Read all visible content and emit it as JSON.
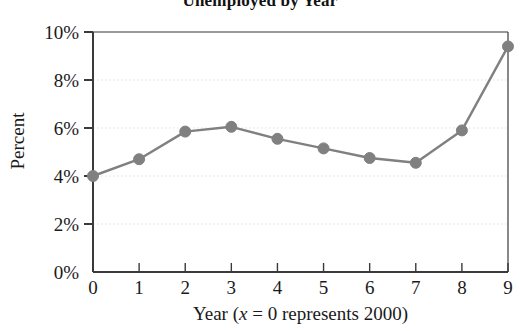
{
  "chart_data": {
    "type": "line",
    "title": "Unemployed by Year",
    "xlabel_prefix": "Year (",
    "xlabel_var": "x",
    "xlabel_suffix": " = 0 represents 2000)",
    "xlabel": "Year (x = 0 represents 2000)",
    "ylabel": "Percent",
    "x": [
      0,
      1,
      2,
      3,
      4,
      5,
      6,
      7,
      8,
      9
    ],
    "values": [
      4.0,
      4.7,
      5.85,
      6.05,
      5.55,
      5.15,
      4.75,
      4.55,
      5.9,
      9.4
    ],
    "xtick_labels": [
      "0",
      "1",
      "2",
      "3",
      "4",
      "5",
      "6",
      "7",
      "8",
      "9"
    ],
    "ytick_values": [
      0,
      2,
      4,
      6,
      8,
      10
    ],
    "ytick_labels": [
      "0%",
      "2%",
      "4%",
      "6%",
      "8%",
      "10%"
    ],
    "xlim": [
      0,
      9
    ],
    "ylim": [
      0,
      10
    ],
    "grid": true,
    "grid_style": "dotted-horizontal",
    "legend": "none",
    "series_color": "#808080",
    "axis_color": "#3a3a3a",
    "grid_color": "#e2e2e2",
    "marker": "circle",
    "marker_radius": 5.5,
    "line_width": 2.4
  }
}
